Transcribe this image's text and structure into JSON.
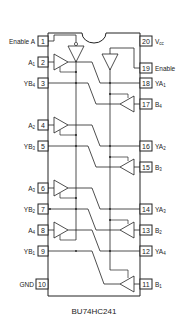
{
  "diagram": {
    "part_number": "BU74HC241",
    "type": "IC pinout / logic diagram",
    "left_pins": [
      {
        "num": "1",
        "label": "Enable A",
        "base": "Enable A",
        "sub": ""
      },
      {
        "num": "2",
        "label": "A1",
        "base": "A",
        "sub": "1"
      },
      {
        "num": "3",
        "label": "YB4",
        "base": "YB",
        "sub": "4"
      },
      {
        "num": "4",
        "label": "A2",
        "base": "A",
        "sub": "2"
      },
      {
        "num": "5",
        "label": "YB3",
        "base": "YB",
        "sub": "3"
      },
      {
        "num": "6",
        "label": "A3",
        "base": "A",
        "sub": "3"
      },
      {
        "num": "7",
        "label": "YB2",
        "base": "YB",
        "sub": "2"
      },
      {
        "num": "8",
        "label": "A4",
        "base": "A",
        "sub": "4"
      },
      {
        "num": "9",
        "label": "YB1",
        "base": "YB",
        "sub": "1"
      },
      {
        "num": "10",
        "label": "GND",
        "base": "GND",
        "sub": ""
      }
    ],
    "right_pins": [
      {
        "num": "20",
        "label": "Vcc",
        "base": "V",
        "sub": "cc"
      },
      {
        "num": "19",
        "label": "Enable",
        "base": "Enable",
        "sub": ""
      },
      {
        "num": "18",
        "label": "YA1",
        "base": "YA",
        "sub": "1"
      },
      {
        "num": "17",
        "label": "B4",
        "base": "B",
        "sub": "4"
      },
      {
        "num": "16",
        "label": "YA2",
        "base": "YA",
        "sub": "2"
      },
      {
        "num": "15",
        "label": "B3",
        "base": "B",
        "sub": "3"
      },
      {
        "num": "14",
        "label": "YA3",
        "base": "YA",
        "sub": "3"
      },
      {
        "num": "13",
        "label": "B2",
        "base": "B",
        "sub": "2"
      },
      {
        "num": "12",
        "label": "YA4",
        "base": "YA",
        "sub": "4"
      },
      {
        "num": "11",
        "label": "B1",
        "base": "B",
        "sub": "1"
      }
    ]
  }
}
